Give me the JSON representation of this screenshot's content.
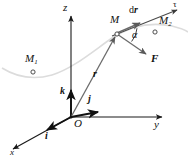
{
  "figure": {
    "background": "#ffffff",
    "width": 188,
    "height": 165,
    "colors": {
      "axis": "#1a1a1a",
      "vector": "#555555",
      "curve": "#d9d9d9",
      "label": "#111111",
      "marker_stroke": "#3a3a3a"
    }
  },
  "axes": [
    {
      "id": "z",
      "label": "z",
      "from": [
        71,
        117
      ],
      "to": [
        71,
        14
      ],
      "arrow": true
    },
    {
      "id": "y",
      "label": "y",
      "from": [
        71,
        117
      ],
      "to": [
        164,
        117
      ],
      "arrow": true
    },
    {
      "id": "x",
      "label": "x",
      "from": [
        71,
        117
      ],
      "to": [
        11,
        150
      ],
      "arrow": true
    }
  ],
  "axis_labels": [
    {
      "name": "z-axis-label",
      "text": "z",
      "x": 63,
      "y": 3
    },
    {
      "name": "y-axis-label",
      "text": "y",
      "x": 155,
      "y": 120
    },
    {
      "name": "x-axis-label",
      "text": "x",
      "x": 11,
      "y": 150
    }
  ],
  "unit_vectors": [
    {
      "id": "k",
      "label": "k",
      "from": [
        71,
        117
      ],
      "to": [
        71,
        88
      ],
      "label_x": 60,
      "label_y": 88
    },
    {
      "id": "j",
      "label": "j",
      "from": [
        71,
        117
      ],
      "to": [
        100,
        112
      ],
      "label_x": 88,
      "label_y": 95
    },
    {
      "id": "i",
      "label": "i",
      "from": [
        71,
        117
      ],
      "to": [
        45,
        131
      ],
      "label_x": 46,
      "label_y": 133
    }
  ],
  "origin": {
    "label": "O",
    "x": 74,
    "y": 119,
    "point": [
      71,
      117
    ]
  },
  "points": [
    {
      "id": "M1",
      "label": "M",
      "sub": "1",
      "marker": [
        33,
        72
      ],
      "label_x": 26,
      "label_y": 55
    },
    {
      "id": "M",
      "label": "M",
      "sub": "",
      "marker": [
        117,
        33
      ],
      "label_x": 110,
      "label_y": 16
    },
    {
      "id": "M2",
      "label": "M",
      "sub": "2",
      "marker": [
        155,
        32
      ],
      "label_x": 160,
      "label_y": 17
    }
  ],
  "vectors": [
    {
      "id": "r",
      "label": "r",
      "bold": true,
      "from": [
        71,
        117
      ],
      "to": [
        117,
        34
      ],
      "label_x": 94,
      "label_y": 72,
      "description": "position vector from origin O to point M"
    },
    {
      "id": "dr",
      "label": "dr",
      "prefix": "d",
      "bold": true,
      "from": [
        117,
        33
      ],
      "to": [
        143,
        22
      ],
      "label_x": 130,
      "label_y": 7,
      "description": "elementary displacement along the tangent"
    },
    {
      "id": "F",
      "label": "F",
      "bold": true,
      "from": [
        117,
        34
      ],
      "to": [
        149,
        56
      ],
      "label_x": 152,
      "label_y": 56,
      "description": "force vector applied at M"
    },
    {
      "id": "tau",
      "label": "τ",
      "bold": false,
      "from": [
        117,
        33
      ],
      "to": [
        179,
        9
      ],
      "label_x": 174,
      "label_y": 0,
      "description": "unit tangent direction of the trajectory"
    }
  ],
  "angle": {
    "id": "alpha",
    "label": "α",
    "vertex": [
      117,
      34
    ],
    "label_x": 134,
    "label_y": 32,
    "description": "angle between dr and F"
  },
  "curve": {
    "id": "trajectory",
    "description": "particle trajectory passing through M1, M and M2",
    "path": "M 2,68 C 18,78 34,80 52,75 C 72,69 92,52 112,38 C 132,25 152,22 172,26 C 180,28 185,30 188,32"
  }
}
